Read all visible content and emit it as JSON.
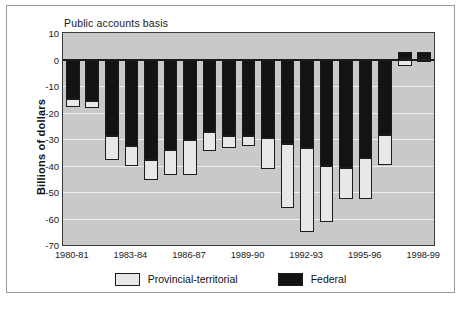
{
  "chart_data": {
    "type": "bar",
    "subtype": "stacked-bar",
    "title": "Public accounts basis",
    "xlabel": "",
    "ylabel": "Billions of dollars",
    "ylim": [
      -70,
      10
    ],
    "ytick_values": [
      10,
      0,
      -10,
      -20,
      -30,
      -40,
      -50,
      -60,
      -70
    ],
    "ytick_labels": [
      "10",
      "0",
      "-10",
      "-20",
      "-30",
      "-40",
      "-50",
      "-60",
      "-70"
    ],
    "grid": true,
    "grid_axis": "y",
    "legend_position": "bottom",
    "categories": [
      "1980-81",
      "1981-82",
      "1982-83",
      "1983-84",
      "1984-85",
      "1985-86",
      "1986-87",
      "1987-88",
      "1988-89",
      "1989-90",
      "1990-91",
      "1991-92",
      "1992-93",
      "1993-94",
      "1994-95",
      "1995-96",
      "1996-97",
      "1997-98",
      "1998-99"
    ],
    "xtick_labels": [
      "1980-81",
      "1983-84",
      "1986-87",
      "1989-90",
      "1992-93",
      "1995-96",
      "1998-99"
    ],
    "xtick_indices": [
      0,
      3,
      6,
      9,
      12,
      15,
      18
    ],
    "series": [
      {
        "name": "Federal",
        "color": "#131313",
        "values": [
          -14.8,
          -15.7,
          -29.0,
          -32.5,
          -38.0,
          -34.0,
          -30.5,
          -27.5,
          -28.8,
          -29.0,
          -29.5,
          -32.0,
          -33.5,
          -40.0,
          -41.0,
          -37.0,
          -28.5,
          3.0,
          3.0
        ]
      },
      {
        "name": "Provincial-territorial",
        "color": "#e8e8e8",
        "values": [
          -3.0,
          -2.7,
          -8.8,
          -7.5,
          -7.5,
          -9.5,
          -13.0,
          -7.0,
          -4.5,
          -3.5,
          -12.0,
          -24.0,
          -31.5,
          -21.5,
          -11.5,
          -15.5,
          -11.5,
          -2.5,
          -1.0
        ]
      }
    ],
    "totals": [
      -17.8,
      -18.4,
      -37.8,
      -40.0,
      -45.5,
      -43.5,
      -43.5,
      -34.5,
      -33.3,
      -32.5,
      -41.5,
      -56.0,
      -65.0,
      -61.5,
      -52.5,
      -52.5,
      -40.0,
      -2.5,
      -1.0
    ]
  },
  "legend": {
    "items": [
      {
        "label": "Provincial-territorial",
        "swatch": "light-square-swatch"
      },
      {
        "label": "Federal",
        "swatch": "dark-square-swatch"
      }
    ]
  }
}
